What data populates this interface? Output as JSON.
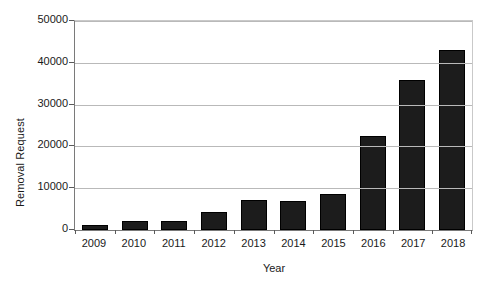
{
  "chart_data": {
    "type": "bar",
    "title": "",
    "xlabel": "Year",
    "ylabel": "Removal Request",
    "categories": [
      "2009",
      "2010",
      "2011",
      "2012",
      "2013",
      "2014",
      "2015",
      "2016",
      "2017",
      "2018"
    ],
    "values": [
      1300,
      2200,
      2200,
      4300,
      7200,
      7000,
      8600,
      22600,
      35800,
      43000
    ],
    "ylim": [
      0,
      50000
    ],
    "yticks": [
      0,
      10000,
      20000,
      30000,
      40000,
      50000
    ],
    "ytick_labels": [
      "0",
      "10000",
      "20000",
      "30000",
      "40000",
      "50000"
    ],
    "grid": true,
    "legend": false,
    "bar_color": "#1c1c1c",
    "grid_color": "#b9b9b9",
    "axis_color": "#7a7a7a"
  }
}
